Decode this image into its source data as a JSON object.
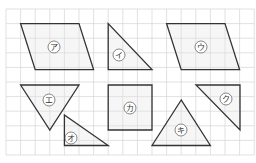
{
  "diagram": {
    "grid": {
      "x0": 6,
      "y0": 9,
      "step": 14.6,
      "cols": 17,
      "rows": 10,
      "color": "#d4d4d4"
    },
    "shapes": [
      {
        "id": "a",
        "label": "ア",
        "type": "parallelogram",
        "points": [
          [
            20.6,
            23.6
          ],
          [
            79,
            23.6
          ],
          [
            93.6,
            69.6
          ],
          [
            35.2,
            69.6
          ]
        ],
        "label_pos": [
          54,
          47
        ]
      },
      {
        "id": "i",
        "label": "イ",
        "type": "right-triangle",
        "points": [
          [
            108.2,
            23.6
          ],
          [
            108.2,
            69.6
          ],
          [
            152,
            69.6
          ]
        ],
        "label_pos": [
          119,
          55
        ]
      },
      {
        "id": "u",
        "label": "ウ",
        "type": "parallelogram",
        "points": [
          [
            166.6,
            23.6
          ],
          [
            225,
            23.6
          ],
          [
            239.6,
            69.6
          ],
          [
            181.2,
            69.6
          ]
        ],
        "label_pos": [
          201,
          47
        ]
      },
      {
        "id": "e",
        "label": "エ",
        "type": "triangle",
        "points": [
          [
            20.6,
            85
          ],
          [
            79,
            85
          ],
          [
            49.8,
            130
          ]
        ],
        "label_pos": [
          49,
          100
        ]
      },
      {
        "id": "o",
        "label": "オ",
        "type": "right-triangle",
        "points": [
          [
            64.4,
            115
          ],
          [
            64.4,
            145.5
          ],
          [
            108.2,
            145.5
          ]
        ],
        "label_pos": [
          71,
          138
        ]
      },
      {
        "id": "ka",
        "label": "カ",
        "type": "square",
        "points": [
          [
            108.2,
            85
          ],
          [
            152,
            85
          ],
          [
            152,
            130
          ],
          [
            108.2,
            130
          ]
        ],
        "label_pos": [
          130,
          108
        ]
      },
      {
        "id": "ki",
        "label": "キ",
        "type": "triangle",
        "points": [
          [
            181.2,
            100
          ],
          [
            152,
            145.5
          ],
          [
            210.4,
            145.5
          ]
        ],
        "label_pos": [
          181,
          130
        ]
      },
      {
        "id": "ku",
        "label": "ク",
        "type": "right-triangle",
        "points": [
          [
            196,
            85
          ],
          [
            240,
            85
          ],
          [
            240,
            130
          ]
        ],
        "label_pos": [
          226,
          99
        ]
      }
    ]
  }
}
